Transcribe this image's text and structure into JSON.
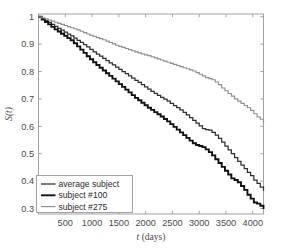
{
  "chart_data": {
    "type": "line",
    "title": "",
    "xlabel": "t (days)",
    "ylabel": "S(t)",
    "xlim": [
      0,
      4200
    ],
    "ylim": [
      0.28,
      1.01
    ],
    "grid": false,
    "legend_position": "lower-left",
    "xticks": [
      500,
      1000,
      1500,
      2000,
      2500,
      3000,
      3500,
      4000
    ],
    "xtick_labels": [
      "500",
      "1000",
      "1500",
      "2000",
      "2500",
      "3000",
      "3500",
      "4000"
    ],
    "yticks": [
      0.3,
      0.4,
      0.5,
      0.6,
      0.7,
      0.8,
      0.9,
      1
    ],
    "ytick_labels": [
      "0.3",
      "0.4",
      "0.5",
      "0.6",
      "0.7",
      "0.8",
      "0.9",
      "1"
    ],
    "series": [
      {
        "name": "average subject",
        "color": "#2f2f2f",
        "width": 1.25,
        "x": [
          0,
          60,
          120,
          180,
          240,
          300,
          360,
          420,
          480,
          540,
          600,
          660,
          720,
          780,
          840,
          900,
          960,
          1020,
          1080,
          1140,
          1200,
          1260,
          1320,
          1380,
          1440,
          1500,
          1560,
          1620,
          1680,
          1740,
          1800,
          1860,
          1920,
          1980,
          2040,
          2100,
          2160,
          2220,
          2280,
          2340,
          2400,
          2460,
          2520,
          2580,
          2640,
          2700,
          2760,
          2820,
          2880,
          2940,
          3000,
          3060,
          3120,
          3180,
          3240,
          3300,
          3360,
          3420,
          3480,
          3540,
          3600,
          3660,
          3720,
          3780,
          3840,
          3900,
          3960,
          4020,
          4080,
          4140,
          4200
        ],
        "y": [
          1.0,
          0.993,
          0.986,
          0.979,
          0.972,
          0.965,
          0.958,
          0.951,
          0.944,
          0.937,
          0.93,
          0.922,
          0.914,
          0.906,
          0.898,
          0.89,
          0.881,
          0.872,
          0.864,
          0.856,
          0.848,
          0.84,
          0.832,
          0.824,
          0.816,
          0.808,
          0.8,
          0.792,
          0.784,
          0.776,
          0.768,
          0.76,
          0.752,
          0.744,
          0.736,
          0.728,
          0.72,
          0.713,
          0.706,
          0.699,
          0.692,
          0.684,
          0.676,
          0.668,
          0.66,
          0.651,
          0.642,
          0.632,
          0.622,
          0.612,
          0.602,
          0.592,
          0.588,
          0.586,
          0.578,
          0.568,
          0.556,
          0.542,
          0.528,
          0.514,
          0.5,
          0.486,
          0.472,
          0.458,
          0.446,
          0.432,
          0.42,
          0.404,
          0.392,
          0.378,
          0.365
        ]
      },
      {
        "name": "subject #100",
        "color": "#111111",
        "width": 1.9,
        "x": [
          0,
          60,
          120,
          180,
          240,
          300,
          360,
          420,
          480,
          540,
          600,
          660,
          720,
          780,
          840,
          900,
          960,
          1020,
          1080,
          1140,
          1200,
          1260,
          1320,
          1380,
          1440,
          1500,
          1560,
          1620,
          1680,
          1740,
          1800,
          1860,
          1920,
          1980,
          2040,
          2100,
          2160,
          2220,
          2280,
          2340,
          2400,
          2460,
          2520,
          2580,
          2640,
          2700,
          2760,
          2820,
          2880,
          2940,
          3000,
          3060,
          3120,
          3180,
          3240,
          3300,
          3360,
          3420,
          3480,
          3540,
          3600,
          3660,
          3720,
          3780,
          3840,
          3900,
          3960,
          4020,
          4080,
          4140,
          4200
        ],
        "y": [
          1.0,
          0.99,
          0.981,
          0.972,
          0.963,
          0.954,
          0.946,
          0.938,
          0.93,
          0.922,
          0.914,
          0.903,
          0.892,
          0.88,
          0.868,
          0.856,
          0.845,
          0.834,
          0.824,
          0.814,
          0.804,
          0.794,
          0.784,
          0.774,
          0.764,
          0.754,
          0.744,
          0.734,
          0.724,
          0.714,
          0.704,
          0.695,
          0.686,
          0.677,
          0.668,
          0.66,
          0.652,
          0.644,
          0.636,
          0.627,
          0.618,
          0.608,
          0.598,
          0.588,
          0.578,
          0.568,
          0.558,
          0.548,
          0.538,
          0.532,
          0.528,
          0.524,
          0.516,
          0.506,
          0.494,
          0.48,
          0.466,
          0.452,
          0.438,
          0.424,
          0.41,
          0.404,
          0.396,
          0.382,
          0.368,
          0.35,
          0.336,
          0.322,
          0.318,
          0.31,
          0.298
        ]
      },
      {
        "name": "subject #275",
        "color": "#8f8f8f",
        "width": 1.15,
        "x": [
          0,
          60,
          120,
          180,
          240,
          300,
          360,
          420,
          480,
          540,
          600,
          660,
          720,
          780,
          840,
          900,
          960,
          1020,
          1080,
          1140,
          1200,
          1260,
          1320,
          1380,
          1440,
          1500,
          1560,
          1620,
          1680,
          1740,
          1800,
          1860,
          1920,
          1980,
          2040,
          2100,
          2160,
          2220,
          2280,
          2340,
          2400,
          2460,
          2520,
          2580,
          2640,
          2700,
          2760,
          2820,
          2880,
          2940,
          3000,
          3060,
          3120,
          3180,
          3240,
          3300,
          3360,
          3420,
          3480,
          3540,
          3600,
          3660,
          3720,
          3780,
          3840,
          3900,
          3960,
          4020,
          4080,
          4140,
          4200
        ],
        "y": [
          1.0,
          0.996,
          0.992,
          0.988,
          0.984,
          0.98,
          0.976,
          0.972,
          0.968,
          0.964,
          0.96,
          0.956,
          0.952,
          0.947,
          0.942,
          0.937,
          0.932,
          0.928,
          0.924,
          0.92,
          0.916,
          0.911,
          0.906,
          0.901,
          0.896,
          0.892,
          0.888,
          0.884,
          0.88,
          0.876,
          0.872,
          0.868,
          0.864,
          0.861,
          0.858,
          0.854,
          0.85,
          0.846,
          0.842,
          0.838,
          0.834,
          0.83,
          0.826,
          0.822,
          0.818,
          0.814,
          0.81,
          0.806,
          0.802,
          0.796,
          0.79,
          0.784,
          0.778,
          0.774,
          0.77,
          0.762,
          0.752,
          0.74,
          0.73,
          0.72,
          0.71,
          0.7,
          0.692,
          0.684,
          0.676,
          0.668,
          0.658,
          0.646,
          0.634,
          0.626,
          0.611
        ]
      }
    ]
  },
  "legend": {
    "items": [
      {
        "label": "average subject"
      },
      {
        "label": "subject #100"
      },
      {
        "label": "subject #275"
      }
    ]
  }
}
